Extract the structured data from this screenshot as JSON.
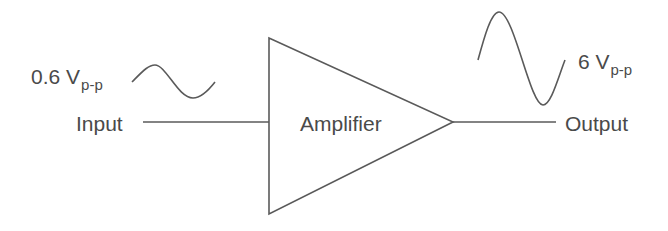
{
  "diagram": {
    "amplifier": {
      "label": "Amplifier"
    },
    "input": {
      "label": "Input",
      "amplitude_value": "0.6 V",
      "amplitude_unit_sub": "p-p"
    },
    "output": {
      "label": "Output",
      "amplitude_value": "6 V",
      "amplitude_unit_sub": "p-p"
    },
    "colors": {
      "stroke": "#5a5a5a",
      "text": "#4a4a4a",
      "background": "#ffffff"
    }
  }
}
